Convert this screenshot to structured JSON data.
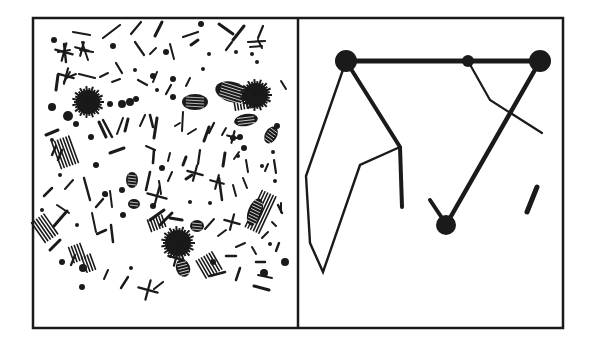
{
  "figure": {
    "ink_color": "#1a1a1a",
    "paper_color": "#ffffff",
    "frame": {
      "left": 33,
      "top": 18,
      "divider": 298,
      "right": 563,
      "bottom": 328,
      "stroke": 2.5
    }
  },
  "left_panel": {
    "name": "scattered-particles",
    "blobs": [
      {
        "x": 88,
        "y": 102,
        "r": 14
      },
      {
        "x": 256,
        "y": 95,
        "r": 14
      },
      {
        "x": 178,
        "y": 243,
        "r": 15
      }
    ],
    "hatched_ovals": [
      {
        "x": 195,
        "y": 102,
        "rx": 13,
        "ry": 8,
        "rot": 0
      },
      {
        "x": 232,
        "y": 92,
        "rx": 17,
        "ry": 10,
        "rot": 15
      },
      {
        "x": 246,
        "y": 120,
        "rx": 12,
        "ry": 6,
        "rot": -10
      },
      {
        "x": 132,
        "y": 180,
        "rx": 6,
        "ry": 8,
        "rot": 0
      },
      {
        "x": 255,
        "y": 212,
        "rx": 7,
        "ry": 14,
        "rot": 20
      },
      {
        "x": 183,
        "y": 268,
        "rx": 7,
        "ry": 9,
        "rot": -20
      },
      {
        "x": 271,
        "y": 135,
        "rx": 6,
        "ry": 9,
        "rot": 30
      },
      {
        "x": 197,
        "y": 226,
        "rx": 7,
        "ry": 6,
        "rot": 0
      },
      {
        "x": 134,
        "y": 204,
        "rx": 6,
        "ry": 5,
        "rot": 0
      }
    ],
    "dots": [
      [
        54,
        40,
        3
      ],
      [
        113,
        46,
        3
      ],
      [
        166,
        52,
        3
      ],
      [
        201,
        24,
        3
      ],
      [
        209,
        54,
        2
      ],
      [
        252,
        54,
        2
      ],
      [
        257,
        62,
        2
      ],
      [
        135,
        70,
        2
      ],
      [
        157,
        90,
        2
      ],
      [
        173,
        97,
        3
      ],
      [
        203,
        69,
        2
      ],
      [
        236,
        52,
        2
      ],
      [
        262,
        96,
        2
      ],
      [
        52,
        107,
        4
      ],
      [
        68,
        116,
        5
      ],
      [
        122,
        104,
        4
      ],
      [
        110,
        104,
        3
      ],
      [
        130,
        102,
        4
      ],
      [
        136,
        99,
        3
      ],
      [
        52,
        140,
        2
      ],
      [
        76,
        124,
        3
      ],
      [
        91,
        137,
        3
      ],
      [
        153,
        76,
        3
      ],
      [
        173,
        79,
        3
      ],
      [
        240,
        137,
        3
      ],
      [
        244,
        148,
        3
      ],
      [
        233,
        138,
        3
      ],
      [
        277,
        126,
        3
      ],
      [
        273,
        152,
        2
      ],
      [
        96,
        165,
        3
      ],
      [
        162,
        168,
        3
      ],
      [
        122,
        190,
        3
      ],
      [
        105,
        194,
        3
      ],
      [
        123,
        215,
        3
      ],
      [
        238,
        156,
        2
      ],
      [
        262,
        166,
        2
      ],
      [
        275,
        181,
        2
      ],
      [
        60,
        175,
        2
      ],
      [
        42,
        210,
        2
      ],
      [
        77,
        225,
        2
      ],
      [
        153,
        206,
        3
      ],
      [
        106,
        195,
        2
      ],
      [
        210,
        203,
        2
      ],
      [
        62,
        262,
        3
      ],
      [
        83,
        268,
        4
      ],
      [
        213,
        262,
        3
      ],
      [
        270,
        244,
        2
      ],
      [
        285,
        262,
        4
      ],
      [
        264,
        273,
        4
      ],
      [
        82,
        287,
        3
      ],
      [
        131,
        268,
        2
      ],
      [
        190,
        202,
        2
      ]
    ],
    "strokes": [
      [
        73,
        32,
        90,
        35,
        2.2
      ],
      [
        103,
        38,
        120,
        25,
        2.2
      ],
      [
        131,
        34,
        141,
        22,
        2.2
      ],
      [
        155,
        36,
        162,
        22,
        3
      ],
      [
        183,
        37,
        198,
        32,
        2.2
      ],
      [
        219,
        24,
        233,
        34,
        3
      ],
      [
        233,
        40,
        244,
        26,
        3
      ],
      [
        258,
        38,
        263,
        26,
        2.2
      ],
      [
        64,
        44,
        66,
        62,
        2.4
      ],
      [
        58,
        52,
        70,
        50,
        2
      ],
      [
        82,
        42,
        88,
        60,
        2
      ],
      [
        80,
        50,
        93,
        52,
        2
      ],
      [
        135,
        42,
        144,
        55,
        2.2
      ],
      [
        150,
        54,
        156,
        48,
        2
      ],
      [
        170,
        44,
        174,
        59,
        2
      ],
      [
        191,
        45,
        198,
        40,
        3
      ],
      [
        226,
        50,
        232,
        42,
        2.2
      ],
      [
        248,
        42,
        265,
        41,
        2.2
      ],
      [
        250,
        47,
        262,
        46,
        2
      ],
      [
        56,
        90,
        58,
        75,
        3
      ],
      [
        66,
        78,
        76,
        74,
        2
      ],
      [
        64,
        82,
        70,
        72,
        2
      ],
      [
        79,
        74,
        95,
        78,
        2.2
      ],
      [
        100,
        77,
        108,
        73,
        2
      ],
      [
        112,
        82,
        120,
        79,
        2
      ],
      [
        116,
        63,
        122,
        73,
        2.2
      ],
      [
        138,
        80,
        147,
        85,
        2.2
      ],
      [
        153,
        82,
        157,
        72,
        2
      ],
      [
        166,
        94,
        171,
        85,
        2.2
      ],
      [
        186,
        86,
        190,
        78,
        2
      ],
      [
        237,
        86,
        247,
        90,
        2
      ],
      [
        245,
        103,
        255,
        102,
        2
      ],
      [
        281,
        81,
        286,
        89,
        2
      ],
      [
        258,
        40,
        262,
        48,
        2
      ],
      [
        46,
        135,
        58,
        130,
        3
      ],
      [
        52,
        155,
        56,
        146,
        2.4
      ],
      [
        99,
        122,
        106,
        137,
        3
      ],
      [
        103,
        120,
        112,
        137,
        2.5
      ],
      [
        117,
        134,
        123,
        118,
        2
      ],
      [
        125,
        131,
        128,
        119,
        3
      ],
      [
        140,
        126,
        145,
        115,
        2
      ],
      [
        150,
        115,
        153,
        127,
        2.6
      ],
      [
        154,
        138,
        157,
        118,
        3
      ],
      [
        175,
        126,
        180,
        123,
        2
      ],
      [
        183,
        112,
        182,
        131,
        2
      ],
      [
        188,
        134,
        196,
        129,
        2
      ],
      [
        204,
        141,
        209,
        127,
        3
      ],
      [
        209,
        133,
        214,
        123,
        2.2
      ],
      [
        222,
        135,
        226,
        128,
        2
      ],
      [
        58,
        160,
        62,
        150,
        2.5
      ],
      [
        110,
        153,
        124,
        148,
        3
      ],
      [
        146,
        146,
        155,
        150,
        2
      ],
      [
        153,
        163,
        154,
        150,
        2.6
      ],
      [
        168,
        161,
        170,
        153,
        2
      ],
      [
        183,
        165,
        186,
        157,
        3
      ],
      [
        198,
        164,
        200,
        150,
        2.2
      ],
      [
        223,
        166,
        225,
        153,
        3
      ],
      [
        234,
        159,
        239,
        152,
        2
      ],
      [
        246,
        160,
        248,
        172,
        2
      ],
      [
        265,
        171,
        268,
        164,
        2
      ],
      [
        274,
        160,
        276,
        173,
        2.2
      ],
      [
        44,
        196,
        52,
        188,
        2.5
      ],
      [
        65,
        189,
        73,
        180,
        2
      ],
      [
        57,
        205,
        69,
        213,
        2
      ],
      [
        84,
        178,
        90,
        200,
        2.4
      ],
      [
        96,
        207,
        103,
        199,
        2.5
      ],
      [
        110,
        191,
        112,
        207,
        2
      ],
      [
        146,
        190,
        150,
        172,
        2.6
      ],
      [
        159,
        181,
        161,
        194,
        2
      ],
      [
        168,
        181,
        172,
        172,
        2
      ],
      [
        186,
        179,
        192,
        175,
        3
      ],
      [
        219,
        178,
        222,
        200,
        2.5
      ],
      [
        233,
        185,
        236,
        196,
        2
      ],
      [
        243,
        178,
        247,
        188,
        2
      ],
      [
        50,
        250,
        60,
        240,
        3
      ],
      [
        54,
        226,
        67,
        211,
        3
      ],
      [
        92,
        213,
        96,
        232,
        2
      ],
      [
        111,
        225,
        113,
        242,
        2.5
      ],
      [
        150,
        220,
        164,
        210,
        3
      ],
      [
        160,
        225,
        172,
        213,
        2.8
      ],
      [
        170,
        218,
        182,
        220,
        3
      ],
      [
        205,
        229,
        214,
        219,
        2
      ],
      [
        218,
        236,
        226,
        230,
        2
      ],
      [
        236,
        247,
        245,
        243,
        2
      ],
      [
        252,
        247,
        256,
        254,
        2
      ],
      [
        262,
        238,
        268,
        232,
        2
      ],
      [
        272,
        222,
        276,
        226,
        2
      ],
      [
        278,
        205,
        282,
        213,
        2.4
      ],
      [
        281,
        203,
        281,
        212,
        2
      ],
      [
        226,
        256,
        236,
        256,
        2.5
      ],
      [
        210,
        276,
        225,
        272,
        2.5
      ],
      [
        236,
        280,
        240,
        268,
        2.5
      ],
      [
        256,
        262,
        265,
        262,
        2.5
      ],
      [
        254,
        286,
        269,
        290,
        3
      ],
      [
        258,
        275,
        272,
        278,
        2
      ],
      [
        276,
        251,
        279,
        243,
        2.4
      ],
      [
        154,
        289,
        163,
        282,
        2.2
      ],
      [
        121,
        288,
        128,
        277,
        2.4
      ],
      [
        104,
        279,
        108,
        270,
        2
      ],
      [
        71,
        265,
        75,
        255,
        2.2
      ],
      [
        97,
        234,
        106,
        230,
        2.5
      ]
    ],
    "crosses": [
      [
        64,
        52,
        9
      ],
      [
        82,
        49,
        7
      ],
      [
        66,
        76,
        8
      ],
      [
        157,
        196,
        10
      ],
      [
        195,
        173,
        8
      ],
      [
        176,
        258,
        8
      ],
      [
        148,
        290,
        10
      ],
      [
        232,
        222,
        8
      ],
      [
        217,
        182,
        7
      ],
      [
        233,
        137,
        6
      ]
    ],
    "hatch_groups": [
      [
        45,
        228,
        8,
        12,
        -35
      ],
      [
        66,
        152,
        10,
        14,
        -20
      ],
      [
        77,
        253,
        6,
        8,
        -20
      ],
      [
        89,
        263,
        5,
        8,
        -20
      ],
      [
        209,
        265,
        9,
        10,
        -30
      ],
      [
        261,
        212,
        8,
        20,
        25
      ],
      [
        248,
        100,
        14,
        8,
        -10
      ],
      [
        157,
        223,
        8,
        6,
        -20
      ]
    ]
  },
  "right_panel": {
    "name": "ordered-network",
    "nodes": [
      {
        "id": "A",
        "x": 346,
        "y": 61,
        "r": 11
      },
      {
        "id": "B",
        "x": 540,
        "y": 61,
        "r": 11
      },
      {
        "id": "C",
        "x": 468,
        "y": 61,
        "r": 6
      },
      {
        "id": "D",
        "x": 446,
        "y": 225,
        "r": 10
      }
    ],
    "thick_lines": [
      {
        "points": [
          [
            346,
            61
          ],
          [
            540,
            61
          ]
        ],
        "width": 5
      },
      {
        "points": [
          [
            346,
            61
          ],
          [
            400,
            147
          ],
          [
            402,
            207
          ]
        ],
        "width": 4
      },
      {
        "points": [
          [
            540,
            61
          ],
          [
            446,
            225
          ]
        ],
        "width": 4.5
      },
      {
        "points": [
          [
            430,
            200
          ],
          [
            442,
            218
          ]
        ],
        "width": 4
      },
      {
        "points": [
          [
            537,
            187
          ],
          [
            527,
            212
          ]
        ],
        "width": 5
      }
    ],
    "thin_lines": [
      {
        "points": [
          [
            346,
            61
          ],
          [
            306,
            176
          ],
          [
            310,
            243
          ],
          [
            323,
            272
          ],
          [
            360,
            165
          ],
          [
            400,
            147
          ]
        ],
        "width": 2.4
      },
      {
        "points": [
          [
            468,
            61
          ],
          [
            490,
            100
          ],
          [
            542,
            133
          ]
        ],
        "width": 2.2
      }
    ]
  }
}
